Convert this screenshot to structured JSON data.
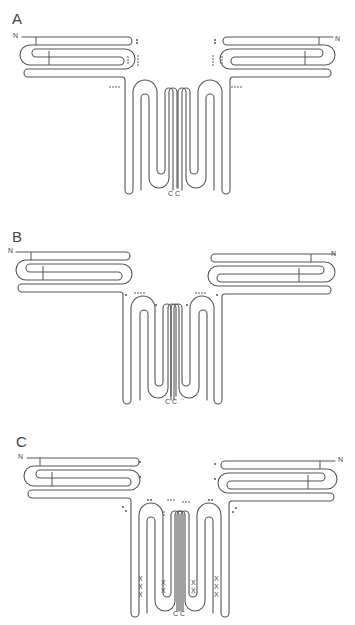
{
  "figure": {
    "panels": [
      {
        "id": "A",
        "label": "A",
        "n_left": "N",
        "n_right": "N",
        "c_labels": [
          "C",
          "C"
        ],
        "markers": [
          "**",
          "*****",
          "****",
          "**",
          "*****",
          "****"
        ]
      },
      {
        "id": "B",
        "label": "B",
        "n_left": "N",
        "n_right": "N",
        "c_labels": [
          "C",
          "C"
        ],
        "markers": [
          "*",
          "****",
          "*",
          "*",
          "****",
          "*"
        ]
      },
      {
        "id": "C",
        "label": "C",
        "n_left": "N",
        "n_right": "N",
        "c_labels": [
          "C",
          "C"
        ],
        "markers": [
          "*",
          "*",
          "**",
          "**",
          "***",
          "***",
          "**",
          "**",
          "*",
          "*"
        ],
        "cross_links": [
          "XXX",
          "XX",
          "XX",
          "XXX"
        ]
      }
    ],
    "colors": {
      "stroke": "#555555",
      "text": "#444444",
      "background": "#ffffff"
    }
  }
}
